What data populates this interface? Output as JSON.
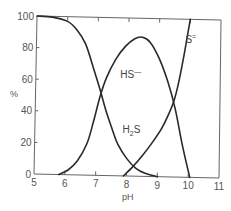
{
  "chart_data": {
    "type": "line",
    "title": "",
    "xlabel": "pH",
    "ylabel": "%",
    "xlim": [
      5,
      11
    ],
    "ylim": [
      0,
      100
    ],
    "x_ticks": [
      5,
      6,
      7,
      8,
      9,
      10,
      11
    ],
    "y_ticks": [
      0,
      20,
      40,
      60,
      80,
      100
    ],
    "grid": false,
    "legend": "inline labels on curves",
    "series": [
      {
        "name": "H2S",
        "label_main": "H",
        "label_sub": "2",
        "label_tail": "S",
        "label_pos": {
          "x": 7.85,
          "y": 27
        },
        "x": [
          5.0,
          5.5,
          6.0,
          6.3,
          6.6,
          6.9,
          7.1,
          7.3,
          7.5,
          7.7,
          8.0,
          8.3,
          8.6,
          9.0
        ],
        "y": [
          100,
          99.5,
          97,
          92,
          83,
          66,
          54,
          41,
          30,
          20,
          11,
          5,
          2,
          0
        ]
      },
      {
        "name": "HS-",
        "label_main": "HS",
        "label_sup": "—",
        "label_pos": {
          "x": 7.75,
          "y": 62
        },
        "x": [
          5.8,
          6.1,
          6.4,
          6.7,
          6.9,
          7.1,
          7.3,
          7.6,
          7.9,
          8.2,
          8.45,
          8.7,
          9.0,
          9.3,
          9.55,
          9.8,
          10.05
        ],
        "y": [
          0,
          3,
          9,
          20,
          34,
          50,
          62,
          74,
          82,
          87,
          88,
          85,
          75,
          60,
          43,
          20,
          0
        ]
      },
      {
        "name": "S2-",
        "label_main": "S",
        "label_sup": "=",
        "label_pos": {
          "x": 9.85,
          "y": 85
        },
        "x": [
          7.9,
          8.2,
          8.5,
          8.8,
          9.1,
          9.3,
          9.5,
          9.65,
          9.8,
          9.9,
          10.0
        ],
        "y": [
          0,
          6,
          13,
          21,
          30,
          38,
          48,
          60,
          76,
          88,
          100
        ]
      }
    ]
  }
}
